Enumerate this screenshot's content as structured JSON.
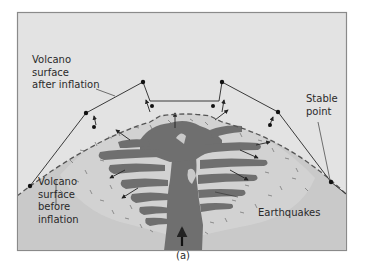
{
  "figure": {
    "caption": "(a)",
    "colors": {
      "frame_border": "#8a8a8a",
      "sky": "#e3e3e3",
      "ground": "#c9c9c9",
      "magma": "#6f6f6f",
      "line": "#3a3a3a",
      "dash": "#555555"
    },
    "labels": {
      "after_inflation": [
        "Volcano",
        "surface",
        "after inflation"
      ],
      "before_inflation": [
        "Volcano",
        "surface",
        "before",
        "inflation"
      ],
      "stable_point": [
        "Stable",
        "point"
      ],
      "earthquakes": "Earthquakes"
    }
  }
}
